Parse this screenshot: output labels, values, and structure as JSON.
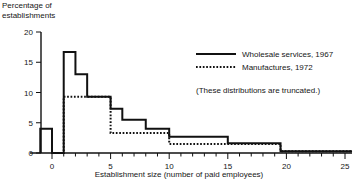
{
  "chart_data": {
    "type": "line",
    "subtype": "step-histogram-outline",
    "title": "",
    "ylabel": "Percentage of\nestablishments",
    "xlabel": "Establishment size (number of paid employees)",
    "xlim": [
      -1,
      25.6
    ],
    "ylim": [
      0,
      20
    ],
    "xticks_major": [
      0,
      5,
      10,
      15,
      20,
      25
    ],
    "xticks_major_labels": [
      "0",
      "5",
      "10",
      "15",
      "20",
      "25"
    ],
    "xticks_minor_step": 1,
    "yticks": [
      0,
      5,
      10,
      15,
      20
    ],
    "ytick_labels": [
      "0",
      "5",
      "10",
      "15",
      "20"
    ],
    "grid": false,
    "legend_position": "upper-right",
    "annotation": "(These distributions are truncated.)",
    "series": [
      {
        "name": "Wholesale services, 1967",
        "style": "solid",
        "color": "#111111",
        "steps": [
          {
            "x_start": -1,
            "x_end": 0,
            "value": 4.0
          },
          {
            "x_start": 0,
            "x_end": 1,
            "value": 0.0
          },
          {
            "x_start": 1,
            "x_end": 2,
            "value": 16.7
          },
          {
            "x_start": 2,
            "x_end": 3,
            "value": 13.0
          },
          {
            "x_start": 3,
            "x_end": 5,
            "value": 9.3
          },
          {
            "x_start": 5,
            "x_end": 6,
            "value": 7.3
          },
          {
            "x_start": 6,
            "x_end": 8,
            "value": 5.5
          },
          {
            "x_start": 8,
            "x_end": 10,
            "value": 4.0
          },
          {
            "x_start": 10,
            "x_end": 15,
            "value": 2.7
          },
          {
            "x_start": 15,
            "x_end": 19.5,
            "value": 1.6
          },
          {
            "x_start": 19.5,
            "x_end": 25.6,
            "value": 0.3
          }
        ]
      },
      {
        "name": "Manufactures, 1972",
        "style": "dotted",
        "color": "#111111",
        "steps": [
          {
            "x_start": 0,
            "x_end": 1,
            "value": 0.0
          },
          {
            "x_start": 1,
            "x_end": 5,
            "value": 9.3
          },
          {
            "x_start": 5,
            "x_end": 10,
            "value": 3.3
          },
          {
            "x_start": 10,
            "x_end": 19.5,
            "value": 1.5
          },
          {
            "x_start": 19.5,
            "x_end": 25.6,
            "value": 0.3
          }
        ]
      }
    ]
  },
  "legend": {
    "entries": [
      {
        "label": "Wholesale services, 1967",
        "style": "solid"
      },
      {
        "label": "Manufactures, 1972",
        "style": "dotted"
      }
    ],
    "note": "(These distributions are truncated.)"
  },
  "axes": {
    "y_title": "Percentage of\nestablishments",
    "x_title": "Establishment size (number of paid employees)",
    "y_tick_labels": [
      "0",
      "5",
      "10",
      "15",
      "20"
    ],
    "x_tick_labels": [
      "0",
      "5",
      "10",
      "15",
      "20",
      "25"
    ]
  }
}
